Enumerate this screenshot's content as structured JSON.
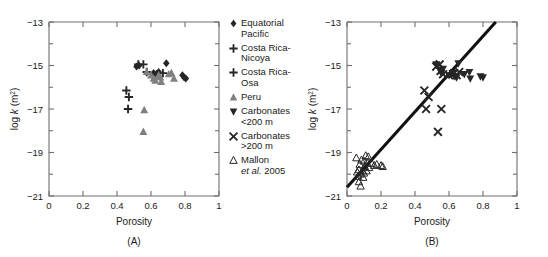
{
  "figure": {
    "axis_color": "#6e6e6e",
    "dark": "#262626",
    "gray": "#808080",
    "line_color": "#111111"
  },
  "panels": [
    {
      "id": "A",
      "label": "(A)",
      "xlabel": "Porosity",
      "ylabel_pre": "log ",
      "ylabel_k": "k",
      "ylabel_post": " (m",
      "ylabel_sup": "2",
      "ylabel_end": ")"
    },
    {
      "id": "B",
      "label": "(B)",
      "xlabel": "Porosity",
      "ylabel_pre": "log ",
      "ylabel_k": "k",
      "ylabel_post": " (m",
      "ylabel_sup": "2",
      "ylabel_end": ")"
    }
  ],
  "legend": {
    "entries": [
      {
        "marker": "filled-diamond-icon",
        "color": "#262626",
        "line1": "Equatorial",
        "line2": "Pacific"
      },
      {
        "marker": "plus-icon",
        "color": "#262626",
        "line1": "Costa Rica-",
        "line2": "Nicoya"
      },
      {
        "marker": "plus-icon",
        "color": "#262626",
        "line1": "Costa Rica-",
        "line2": "Osa"
      },
      {
        "marker": "filled-up-triangle-icon",
        "color": "#808080",
        "line1": "Peru",
        "line2": ""
      },
      {
        "marker": "filled-down-triangle-icon",
        "color": "#262626",
        "line1": "Carbonates",
        "line2": "<200 m"
      },
      {
        "marker": "cross-x-icon",
        "color": "#262626",
        "line1": "Carbonates",
        "line2": ">200 m"
      },
      {
        "marker": "open-up-triangle-icon",
        "color": "#262626",
        "line1": "Mallon",
        "line2": "et al. 2005",
        "line2_italic_part": "et al."
      }
    ]
  },
  "chart_data": [
    {
      "type": "scatter",
      "panel": "A",
      "title": "",
      "xlabel": "Porosity",
      "ylabel": "log k (m2)",
      "xlim": [
        0,
        1
      ],
      "ylim": [
        -21,
        -13
      ],
      "xticks": [
        0,
        0.2,
        0.4,
        0.6,
        0.8,
        1
      ],
      "xticklabels": [
        "0",
        "0.2",
        "0.4",
        "0.6",
        "0.8",
        "1"
      ],
      "yticks": [
        -21,
        -19,
        -17,
        -15,
        -13
      ],
      "yticklabels": [
        "-21",
        "-19",
        "-17",
        "-15",
        "-13"
      ],
      "yminorticks": [
        -20,
        -18,
        -16,
        -14
      ],
      "grid": false,
      "legend_position": "right-outside",
      "series": [
        {
          "name": "Equatorial Pacific",
          "marker": "filled-diamond",
          "color": "#262626",
          "points": [
            {
              "x": 0.515,
              "y": -15.05
            },
            {
              "x": 0.53,
              "y": -15.0
            },
            {
              "x": 0.615,
              "y": -15.35
            },
            {
              "x": 0.63,
              "y": -15.4
            },
            {
              "x": 0.645,
              "y": -15.3
            },
            {
              "x": 0.69,
              "y": -14.9
            },
            {
              "x": 0.785,
              "y": -15.45
            },
            {
              "x": 0.795,
              "y": -15.55
            },
            {
              "x": 0.805,
              "y": -15.6
            }
          ]
        },
        {
          "name": "Costa Rica-Nicoya",
          "marker": "plus",
          "color": "#262626",
          "points": [
            {
              "x": 0.525,
              "y": -14.95
            },
            {
              "x": 0.555,
              "y": -14.95
            },
            {
              "x": 0.575,
              "y": -15.3
            },
            {
              "x": 0.635,
              "y": -15.4
            },
            {
              "x": 0.67,
              "y": -15.35
            }
          ]
        },
        {
          "name": "Costa Rica-Osa",
          "marker": "plus",
          "color": "#262626",
          "points": [
            {
              "x": 0.455,
              "y": -16.15
            },
            {
              "x": 0.47,
              "y": -16.45
            },
            {
              "x": 0.465,
              "y": -17.0
            }
          ]
        },
        {
          "name": "Peru",
          "marker": "filled-up-triangle",
          "color": "#808080",
          "points": [
            {
              "x": 0.575,
              "y": -15.3
            },
            {
              "x": 0.6,
              "y": -15.45
            },
            {
              "x": 0.615,
              "y": -15.6
            },
            {
              "x": 0.625,
              "y": -15.7
            },
            {
              "x": 0.645,
              "y": -15.45
            },
            {
              "x": 0.655,
              "y": -15.55
            },
            {
              "x": 0.66,
              "y": -15.75
            },
            {
              "x": 0.705,
              "y": -15.4
            },
            {
              "x": 0.72,
              "y": -15.35
            },
            {
              "x": 0.735,
              "y": -15.6
            },
            {
              "x": 0.56,
              "y": -17.05
            },
            {
              "x": 0.555,
              "y": -18.05
            }
          ]
        }
      ]
    },
    {
      "type": "scatter",
      "panel": "B",
      "title": "",
      "xlabel": "Porosity",
      "ylabel": "log k (m2)",
      "xlim": [
        0,
        1
      ],
      "ylim": [
        -21,
        -13
      ],
      "xticks": [
        0,
        0.2,
        0.4,
        0.6,
        0.8,
        1
      ],
      "xticklabels": [
        "0",
        "0.2",
        "0.4",
        "0.6",
        "0.8",
        "1"
      ],
      "yticks": [
        -21,
        -19,
        -17,
        -15,
        -13
      ],
      "yticklabels": [
        "-21",
        "-19",
        "-17",
        "-15",
        "-13"
      ],
      "yminorticks": [
        -20,
        -18,
        -16,
        -14
      ],
      "grid": false,
      "legend_position": "none",
      "fit_line": {
        "x0": 0.0,
        "y0": -20.6,
        "x1": 0.875,
        "y1": -13.0,
        "width": 3.1,
        "color": "#111111"
      },
      "series": [
        {
          "name": "Carbonates <200 m",
          "marker": "filled-down-triangle",
          "color": "#262626",
          "points": [
            {
              "x": 0.525,
              "y": -14.95
            },
            {
              "x": 0.545,
              "y": -15.2
            },
            {
              "x": 0.555,
              "y": -15.35
            },
            {
              "x": 0.565,
              "y": -15.15
            },
            {
              "x": 0.6,
              "y": -15.45
            },
            {
              "x": 0.62,
              "y": -15.35
            },
            {
              "x": 0.635,
              "y": -15.5
            },
            {
              "x": 0.645,
              "y": -15.55
            },
            {
              "x": 0.655,
              "y": -14.9
            },
            {
              "x": 0.69,
              "y": -15.4
            },
            {
              "x": 0.72,
              "y": -15.3
            },
            {
              "x": 0.725,
              "y": -15.6
            },
            {
              "x": 0.785,
              "y": -15.5
            },
            {
              "x": 0.8,
              "y": -15.55
            }
          ]
        },
        {
          "name": "Carbonates >200 m",
          "marker": "cross-x",
          "color": "#262626",
          "points": [
            {
              "x": 0.525,
              "y": -15.05
            },
            {
              "x": 0.545,
              "y": -14.95
            },
            {
              "x": 0.55,
              "y": -15.25
            },
            {
              "x": 0.565,
              "y": -15.4
            },
            {
              "x": 0.6,
              "y": -15.45
            },
            {
              "x": 0.63,
              "y": -15.35
            },
            {
              "x": 0.645,
              "y": -15.45
            },
            {
              "x": 0.66,
              "y": -15.3
            },
            {
              "x": 0.455,
              "y": -16.15
            },
            {
              "x": 0.48,
              "y": -16.45
            },
            {
              "x": 0.465,
              "y": -17.0
            },
            {
              "x": 0.555,
              "y": -17.0
            },
            {
              "x": 0.535,
              "y": -18.05
            }
          ]
        },
        {
          "name": "Mallon et al. 2005",
          "marker": "open-up-triangle",
          "color": "#262626",
          "points": [
            {
              "x": 0.055,
              "y": -19.25
            },
            {
              "x": 0.06,
              "y": -19.9
            },
            {
              "x": 0.065,
              "y": -20.1
            },
            {
              "x": 0.07,
              "y": -19.8
            },
            {
              "x": 0.07,
              "y": -20.35
            },
            {
              "x": 0.075,
              "y": -19.55
            },
            {
              "x": 0.08,
              "y": -20.0
            },
            {
              "x": 0.08,
              "y": -20.55
            },
            {
              "x": 0.085,
              "y": -19.35
            },
            {
              "x": 0.09,
              "y": -19.85
            },
            {
              "x": 0.095,
              "y": -20.15
            },
            {
              "x": 0.1,
              "y": -19.4
            },
            {
              "x": 0.1,
              "y": -19.95
            },
            {
              "x": 0.105,
              "y": -19.65
            },
            {
              "x": 0.11,
              "y": -19.15
            },
            {
              "x": 0.115,
              "y": -19.85
            },
            {
              "x": 0.12,
              "y": -19.5
            },
            {
              "x": 0.125,
              "y": -19.2
            },
            {
              "x": 0.13,
              "y": -19.7
            },
            {
              "x": 0.145,
              "y": -19.5
            },
            {
              "x": 0.16,
              "y": -19.6
            },
            {
              "x": 0.175,
              "y": -19.55
            },
            {
              "x": 0.2,
              "y": -19.6
            },
            {
              "x": 0.21,
              "y": -19.65
            }
          ]
        }
      ]
    }
  ]
}
